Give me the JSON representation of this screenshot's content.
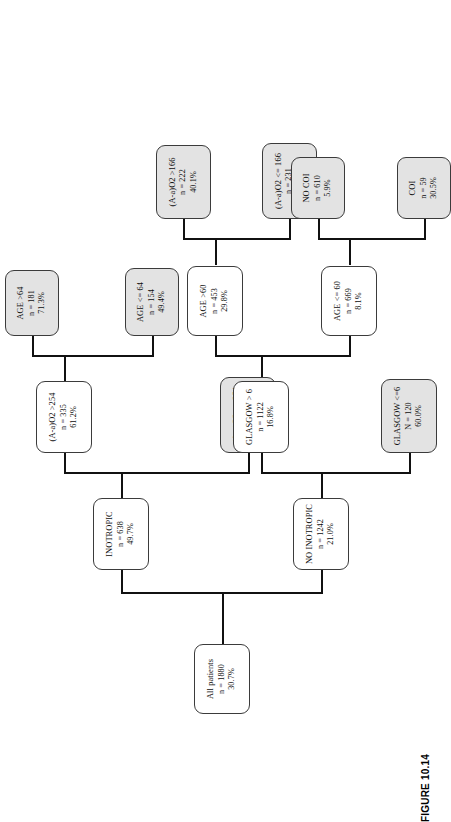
{
  "figure": {
    "caption": "FIGURE 10.14",
    "type": "decision-tree",
    "orientation": "rotated-90-ccw",
    "colors": {
      "line": "#111111",
      "node_border": "#3b3b3b",
      "internal_node_fill": "#ffffff",
      "leaf_node_fill": "#e3e3e3",
      "text": "#0d0d0d",
      "page_background": "#ffffff"
    }
  },
  "tree": {
    "root": {
      "id": "all-patients",
      "title": "All patients",
      "count": "n = 1880",
      "percent": "30.7%",
      "kind": "root"
    },
    "nodes": [
      {
        "id": "inotropic",
        "title": "INOTROPIC",
        "count": "n = 638",
        "percent": "49.7%",
        "kind": "internal",
        "depth": 1
      },
      {
        "id": "no-inotropic",
        "title": "NO INOTROPIC",
        "count": "n = 1242",
        "percent": "21.0%",
        "kind": "internal",
        "depth": 1
      },
      {
        "id": "aao2-gt-254",
        "title": "(A-a)O2 >254",
        "count": "n = 335",
        "percent": "61.2%",
        "kind": "internal",
        "depth": 2
      },
      {
        "id": "aao2-le-254",
        "title": "(A-a)O2 <= 254",
        "count": "n = 303",
        "percent": "37.0%",
        "kind": "leaf",
        "depth": 2
      },
      {
        "id": "age-gt-64",
        "title": "AGE >64",
        "count": "n = 181",
        "percent": "71.3%",
        "kind": "leaf",
        "depth": 3
      },
      {
        "id": "age-le-64",
        "title": "AGE <= 64",
        "count": "n = 154",
        "percent": "49.4%",
        "kind": "leaf",
        "depth": 3
      },
      {
        "id": "glasgow-gt-6",
        "title": "GLASGOW > 6",
        "count": "n = 1122",
        "percent": "16.8%",
        "kind": "internal",
        "depth": 2
      },
      {
        "id": "glasgow-le-6",
        "title": "GLASGOW <=6",
        "count": "N = 120",
        "percent": "60.0%",
        "kind": "leaf",
        "depth": 2
      },
      {
        "id": "age-gt-60",
        "title": "AGE >60",
        "count": "n = 453",
        "percent": "29.8%",
        "kind": "internal",
        "depth": 3
      },
      {
        "id": "age-le-60",
        "title": "AGE <= 60",
        "count": "n = 669",
        "percent": "8.1%",
        "kind": "internal",
        "depth": 3
      },
      {
        "id": "aao2-gt-166",
        "title": "(A-a)O2 >166",
        "count": "n = 222",
        "percent": "40.1%",
        "kind": "leaf",
        "depth": 4
      },
      {
        "id": "aao2-le-166",
        "title": "(A-a)O2 <= 166",
        "count": "n = 231",
        "percent": "19.9%",
        "kind": "leaf",
        "depth": 4
      },
      {
        "id": "no-coi",
        "title": "NO COI",
        "count": "n = 610",
        "percent": "5.9%",
        "kind": "leaf",
        "depth": 4
      },
      {
        "id": "coi",
        "title": "COI",
        "count": "n = 59",
        "percent": "30.5%",
        "kind": "leaf",
        "depth": 4
      }
    ]
  }
}
